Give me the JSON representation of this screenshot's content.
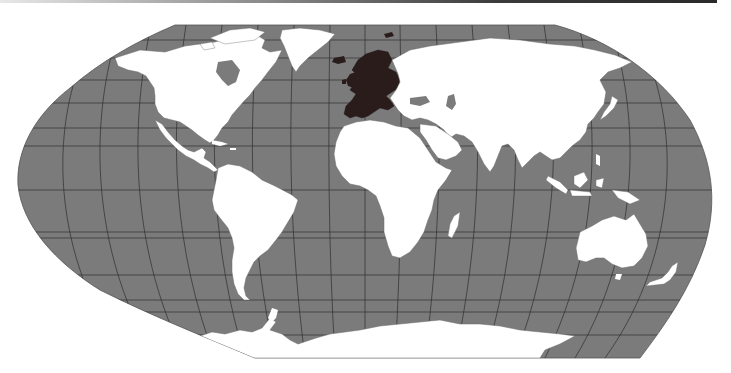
{
  "map": {
    "projection": "Robinson",
    "subject": "World map with Europe highlighted",
    "highlighted_region": "Europe",
    "colors": {
      "ocean": "#7b7b7b",
      "land": "#ffffff",
      "highlight": "#2b1c1c",
      "graticule": "#2e2e2e",
      "border": "#6a6a6a",
      "background": "#ffffff",
      "top_rule": "#2a2a2a"
    },
    "graticule": {
      "meridian_spacing_deg": 15,
      "parallel_spacing_deg": 15,
      "special_parallels": [
        "Arctic Circle",
        "Tropic of Cancer",
        "Equator",
        "Tropic of Capricorn",
        "Antarctic Circle"
      ]
    },
    "landmasses": [
      {
        "name": "North America",
        "state": "land"
      },
      {
        "name": "Greenland",
        "state": "land"
      },
      {
        "name": "South America",
        "state": "land"
      },
      {
        "name": "Europe",
        "state": "highlighted"
      },
      {
        "name": "Africa",
        "state": "land"
      },
      {
        "name": "Asia",
        "state": "land"
      },
      {
        "name": "Australia",
        "state": "land"
      },
      {
        "name": "New Zealand",
        "state": "land"
      },
      {
        "name": "Madagascar",
        "state": "land"
      },
      {
        "name": "Antarctica",
        "state": "land"
      },
      {
        "name": "Japan",
        "state": "land"
      },
      {
        "name": "Indonesia",
        "state": "land"
      },
      {
        "name": "Iceland",
        "state": "highlighted"
      },
      {
        "name": "British Isles",
        "state": "highlighted"
      }
    ]
  }
}
